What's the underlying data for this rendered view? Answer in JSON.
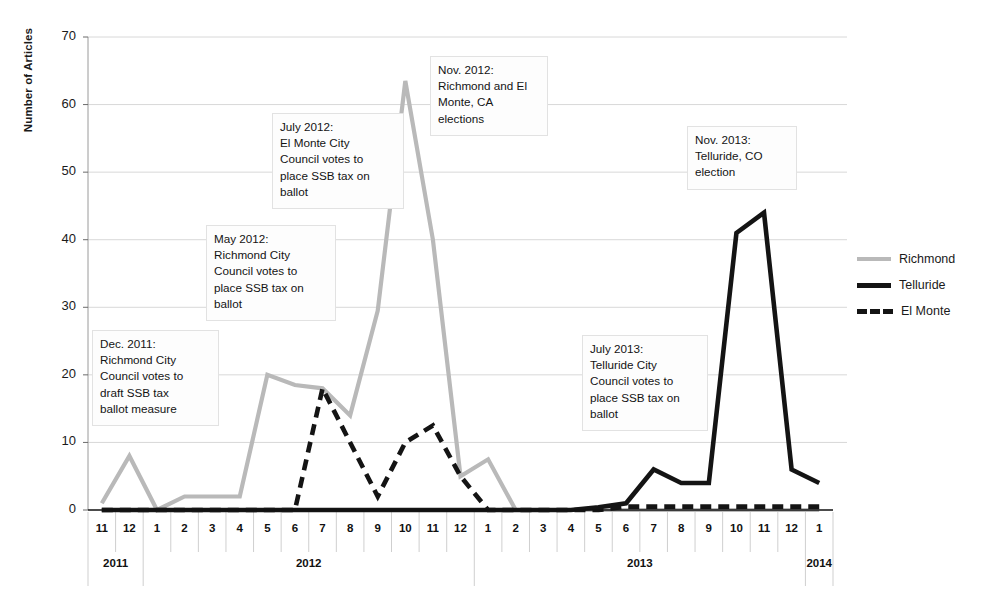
{
  "chart_data": {
    "type": "line",
    "title": "",
    "xlabel": "",
    "ylabel": "Number of Articles",
    "ylim": [
      0,
      70
    ],
    "yticks": [
      0,
      10,
      20,
      30,
      40,
      50,
      60,
      70
    ],
    "grid": true,
    "legend_position": "right",
    "categories": [
      "11",
      "12",
      "1",
      "2",
      "3",
      "4",
      "5",
      "6",
      "7",
      "8",
      "9",
      "10",
      "11",
      "12",
      "1",
      "2",
      "3",
      "4",
      "5",
      "6",
      "7",
      "8",
      "9",
      "10",
      "11",
      "12",
      "1"
    ],
    "year_groups": [
      {
        "label": "2011",
        "start_index": 0,
        "end_index": 1
      },
      {
        "label": "2012",
        "start_index": 2,
        "end_index": 13
      },
      {
        "label": "2013",
        "start_index": 14,
        "end_index": 25
      },
      {
        "label": "2014",
        "start_index": 26,
        "end_index": 26
      }
    ],
    "series": [
      {
        "name": "Richmond",
        "color": "#b9b9b9",
        "style": "solid",
        "values": [
          1,
          8,
          0,
          2,
          2,
          2,
          20,
          18.5,
          18,
          14,
          29.5,
          63.5,
          40,
          5,
          7.5,
          0,
          0,
          0,
          0,
          0,
          0,
          0,
          0,
          0,
          0,
          0,
          0
        ]
      },
      {
        "name": "Telluride",
        "color": "#141414",
        "style": "solid",
        "values": [
          0,
          0,
          0,
          0,
          0,
          0,
          0,
          0,
          0,
          0,
          0,
          0,
          0,
          0,
          0,
          0,
          0,
          0,
          0.4,
          1,
          6,
          4,
          4,
          41,
          44,
          6,
          4
        ]
      },
      {
        "name": "El Monte",
        "color": "#141414",
        "style": "dashed",
        "values": [
          0,
          0,
          0,
          0,
          0,
          0,
          0,
          0,
          18,
          10,
          2,
          10,
          12.5,
          5,
          0,
          0,
          0,
          0,
          0,
          0.5,
          0.5,
          0.5,
          0.5,
          0.5,
          0.5,
          0.5,
          0.5
        ]
      }
    ],
    "annotations": [
      {
        "id": "dec-2011",
        "text": "Dec. 2011:\nRichmond City\nCouncil votes to\ndraft SSB tax\nballot measure",
        "x": 92,
        "y": 330,
        "width": 127,
        "height": 96
      },
      {
        "id": "may-2012",
        "text": "May 2012:\nRichmond City\nCouncil votes to\nplace SSB tax on\nballot",
        "x": 206,
        "y": 225,
        "width": 130,
        "height": 96
      },
      {
        "id": "july-2012",
        "text": "July 2012:\nEl Monte City\nCouncil votes to\nplace SSB tax on\nballot",
        "x": 272,
        "y": 113,
        "width": 132,
        "height": 96
      },
      {
        "id": "nov-2012",
        "text": "Nov. 2012:\nRichmond and El\nMonte, CA\nelections",
        "x": 430,
        "y": 56,
        "width": 118,
        "height": 80
      },
      {
        "id": "nov-2013",
        "text": "Nov. 2013:\nTelluride, CO\nelection",
        "x": 687,
        "y": 126,
        "width": 110,
        "height": 64
      },
      {
        "id": "july-2013",
        "text": "July 2013:\nTelluride City\nCouncil votes to\nplace SSB tax on\nballot",
        "x": 582,
        "y": 335,
        "width": 126,
        "height": 96
      }
    ]
  }
}
